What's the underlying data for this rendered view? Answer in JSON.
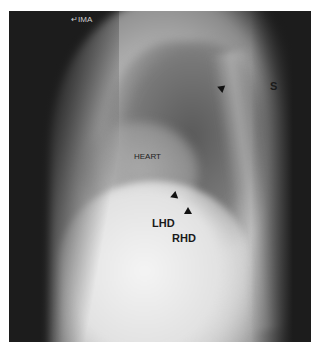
{
  "image": {
    "description": "Lateral chest radiograph",
    "orientation_marker": "↵ΙΜΑ"
  },
  "labels": {
    "s": "S",
    "heart": "HEART",
    "lhd": "LHD",
    "rhd": "RHD"
  },
  "colors": {
    "background": "#ffffff",
    "film_dark": "#1c1c1c",
    "label_text": "#1a1a1a"
  }
}
